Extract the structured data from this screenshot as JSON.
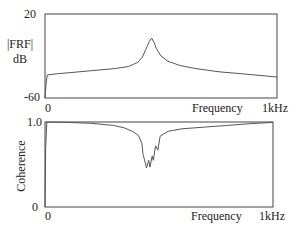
{
  "chart_data": [
    {
      "type": "line",
      "title": "",
      "ylabel": "|FRF| dB",
      "ylabel_lines": [
        "|FRF|",
        "dB"
      ],
      "xlabel": "Frequency",
      "x_unit_label": "1kHz",
      "x_tick_labels": [
        "0",
        "1kHz"
      ],
      "y_tick_labels": [
        "20",
        "-60"
      ],
      "xlim": [
        0,
        1000
      ],
      "ylim": [
        -60,
        20
      ],
      "grid": false,
      "series": [
        {
          "name": "FRF magnitude",
          "x": [
            0,
            5,
            10,
            50,
            100,
            200,
            300,
            360,
            400,
            420,
            440,
            450,
            460,
            470,
            480,
            500,
            530,
            580,
            650,
            750,
            850,
            1000
          ],
          "y": [
            -60,
            -45,
            -38,
            -37,
            -36,
            -34,
            -32,
            -30,
            -26,
            -21,
            -11,
            -6,
            -3,
            -7,
            -13,
            -20,
            -25,
            -29,
            -32,
            -35,
            -37,
            -40
          ]
        }
      ]
    },
    {
      "type": "line",
      "title": "",
      "ylabel": "Coherence",
      "xlabel": "Frequency",
      "x_unit_label": "1kHz",
      "x_tick_labels": [
        "0",
        "1kHz"
      ],
      "y_tick_labels": [
        "1.0",
        "0"
      ],
      "xlim": [
        0,
        1000
      ],
      "ylim": [
        0,
        1.0
      ],
      "grid": false,
      "series": [
        {
          "name": "Coherence",
          "x": [
            0,
            3,
            8,
            100,
            200,
            300,
            350,
            390,
            410,
            425,
            430,
            440,
            445,
            455,
            460,
            470,
            475,
            485,
            495,
            505,
            520,
            540,
            560,
            600,
            700,
            800,
            900,
            1000
          ],
          "y": [
            0.0,
            0.7,
            1.0,
            0.995,
            0.985,
            0.96,
            0.93,
            0.88,
            0.84,
            0.75,
            0.62,
            0.52,
            0.46,
            0.55,
            0.47,
            0.6,
            0.55,
            0.72,
            0.67,
            0.83,
            0.86,
            0.89,
            0.9,
            0.92,
            0.94,
            0.96,
            0.98,
            0.995
          ]
        }
      ]
    }
  ]
}
